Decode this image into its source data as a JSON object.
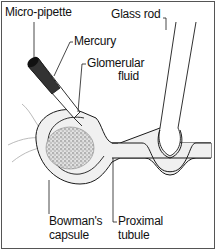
{
  "diagram": {
    "labels": {
      "micro_pipette": "Micro-pipette",
      "mercury": "Mercury",
      "glomerular_fluid_line1": "Glomerular",
      "glomerular_fluid_line2": "fluid",
      "glass_rod": "Glass rod",
      "bowmans_capsule_line1": "Bowman's",
      "bowmans_capsule_line2": "capsule",
      "proximal_tubule_line1": "Proximal",
      "proximal_tubule_line2": "tubule"
    },
    "colors": {
      "outline": "#1a1a1a",
      "capsule_fill": "#f0f0f0",
      "glomerulus_fill": "#d9d9d9",
      "mercury_fill": "#333333",
      "background": "#ffffff"
    }
  }
}
